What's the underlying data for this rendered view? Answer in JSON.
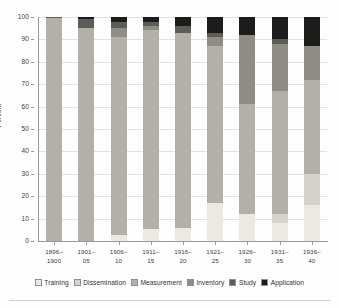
{
  "chart_data": {
    "type": "bar",
    "subtype": "stacked-bar-100-percent",
    "title": "",
    "xlabel": "",
    "ylabel": "Percent",
    "ylim": [
      0,
      100
    ],
    "ytick_values": [
      0,
      10,
      20,
      30,
      40,
      50,
      60,
      70,
      80,
      90,
      100
    ],
    "ytick_labels": [
      "0",
      "10",
      "20",
      "30",
      "40",
      "50",
      "60",
      "70",
      "80",
      "90",
      "100"
    ],
    "grid": true,
    "legend_position": "bottom",
    "categories": [
      "1896-1900",
      "1901-05",
      "1906-10",
      "1911-15",
      "1916-20",
      "1921-25",
      "1926-30",
      "1931-35",
      "1936-40"
    ],
    "category_labels": [
      {
        "line1": "1896–",
        "line2": "1900"
      },
      {
        "line1": "1901–",
        "line2": "05"
      },
      {
        "line1": "1906–",
        "line2": "10"
      },
      {
        "line1": "1911–",
        "line2": "15"
      },
      {
        "line1": "1916–",
        "line2": "20"
      },
      {
        "line1": "1921–",
        "line2": "25"
      },
      {
        "line1": "1926–",
        "line2": "30"
      },
      {
        "line1": "1931–",
        "line2": "35"
      },
      {
        "line1": "1936–",
        "line2": "40"
      }
    ],
    "series": [
      {
        "name": "Training",
        "color": "#ebe9e1",
        "values": [
          0,
          0,
          2.5,
          5.5,
          6,
          17,
          12,
          8,
          16
        ]
      },
      {
        "name": "Dissemination",
        "color": "#d5d3c9",
        "values": [
          0,
          0,
          0,
          0,
          0,
          0,
          0,
          4,
          14
        ]
      },
      {
        "name": "Measurement",
        "color": "#b3b1a7",
        "values": [
          99.5,
          95,
          88.5,
          88.5,
          87,
          70,
          49,
          55,
          42
        ]
      },
      {
        "name": "Inventory",
        "color": "#8e8c85",
        "values": [
          0,
          0,
          4,
          2,
          0,
          4,
          31,
          21,
          15
        ]
      },
      {
        "name": "Study",
        "color": "#5d5c58",
        "values": [
          0.5,
          4,
          3,
          2,
          3,
          2,
          0,
          2,
          0
        ]
      },
      {
        "name": "Application",
        "color": "#1c1c1a",
        "values": [
          0,
          1,
          2,
          2,
          4,
          7,
          8,
          10,
          13
        ]
      }
    ]
  },
  "legend": {
    "items": [
      {
        "label": "Training"
      },
      {
        "label": "Dissemination"
      },
      {
        "label": "Measurement"
      },
      {
        "label": "Inventory"
      },
      {
        "label": "Study"
      },
      {
        "label": "Application"
      }
    ]
  },
  "colors": {
    "background": "#fefefe",
    "axis": "#9a9a9a",
    "gridline": "#e2e2e2",
    "text": "#3c3c3c",
    "training": "#ebe9e1",
    "dissemination": "#d5d3c9",
    "measurement": "#b3b1a7",
    "inventory": "#8e8c85",
    "study": "#5d5c58",
    "application": "#1c1c1a"
  }
}
